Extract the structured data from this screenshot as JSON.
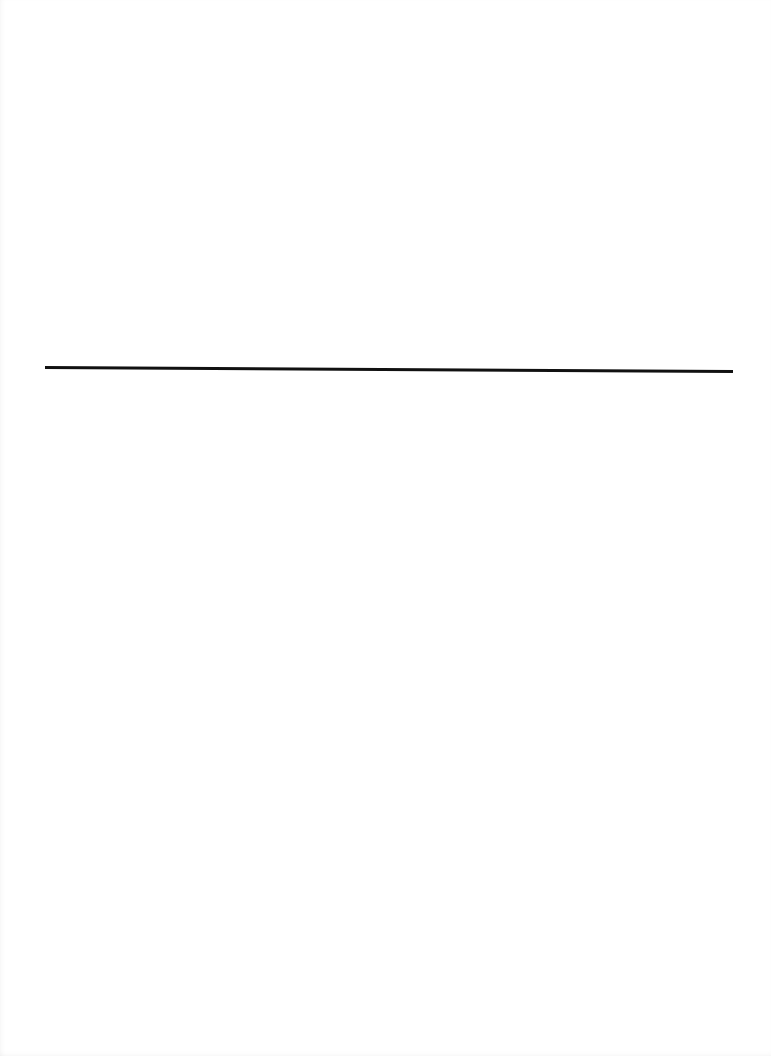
{
  "page": {
    "background": "#ffffff",
    "rule": {
      "color": "#111111",
      "x_start": 45,
      "x_end": 733,
      "y_left": 366,
      "y_right": 370,
      "thickness": 3
    }
  }
}
